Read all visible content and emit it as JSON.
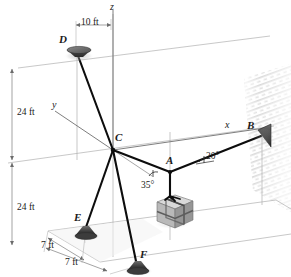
{
  "figure": {
    "type": "engineering-statics-diagram"
  },
  "axes": [
    {
      "name": "z-axis",
      "label": "z"
    },
    {
      "name": "y-axis",
      "label": "y"
    },
    {
      "name": "x-axis",
      "label": "x"
    }
  ],
  "points": [
    {
      "id": "D",
      "label": "D",
      "kind": "ceiling-anchor"
    },
    {
      "id": "C",
      "label": "C",
      "kind": "cable-junction"
    },
    {
      "id": "A",
      "label": "A",
      "kind": "cable-junction"
    },
    {
      "id": "B",
      "label": "B",
      "kind": "wall-anchor"
    },
    {
      "id": "E",
      "label": "E",
      "kind": "floor-anchor"
    },
    {
      "id": "F",
      "label": "F",
      "kind": "floor-anchor"
    }
  ],
  "dimensions": [
    {
      "name": "width-10ft",
      "label": "10 ft",
      "orientation": "horizontal"
    },
    {
      "name": "height-upper-24ft",
      "label": "24 ft",
      "orientation": "vertical"
    },
    {
      "name": "height-lower-24ft",
      "label": "24 ft",
      "orientation": "vertical"
    },
    {
      "name": "depth-7ft-upper",
      "label": "7 ft",
      "orientation": "oblique"
    },
    {
      "name": "depth-7ft-lower",
      "label": "7 ft",
      "orientation": "oblique"
    }
  ],
  "angles": [
    {
      "name": "angle-at-A-to-C",
      "label": "35°",
      "value": 35,
      "unit": "deg"
    },
    {
      "name": "angle-at-A-to-B",
      "label": "20°",
      "value": 20,
      "unit": "deg"
    }
  ],
  "members": [
    {
      "name": "cable-C-D",
      "from": "C",
      "to": "D"
    },
    {
      "name": "cable-C-E",
      "from": "C",
      "to": "E"
    },
    {
      "name": "cable-C-F",
      "from": "C",
      "to": "F"
    },
    {
      "name": "cable-C-A",
      "from": "C",
      "to": "A"
    },
    {
      "name": "cable-A-B",
      "from": "A",
      "to": "B"
    },
    {
      "name": "sling-A-crate",
      "from": "A",
      "to": "crate"
    }
  ],
  "objects": [
    {
      "name": "crate",
      "kind": "strapped-box"
    },
    {
      "name": "wall",
      "kind": "hatched-wall-surface"
    }
  ],
  "colors": {
    "cable": "#111111",
    "construction_line": "#a9a9a9",
    "dimension_line": "#8c8c8c",
    "anchor_fill": "#4a4a4a",
    "crate_face_light": "#d6d6d6",
    "crate_face_mid": "#b4b4b4",
    "crate_face_dark": "#8f8f8f",
    "wall_hatch": "#c9c9c9",
    "text": "#1a1a1a",
    "background": "#ffffff"
  }
}
